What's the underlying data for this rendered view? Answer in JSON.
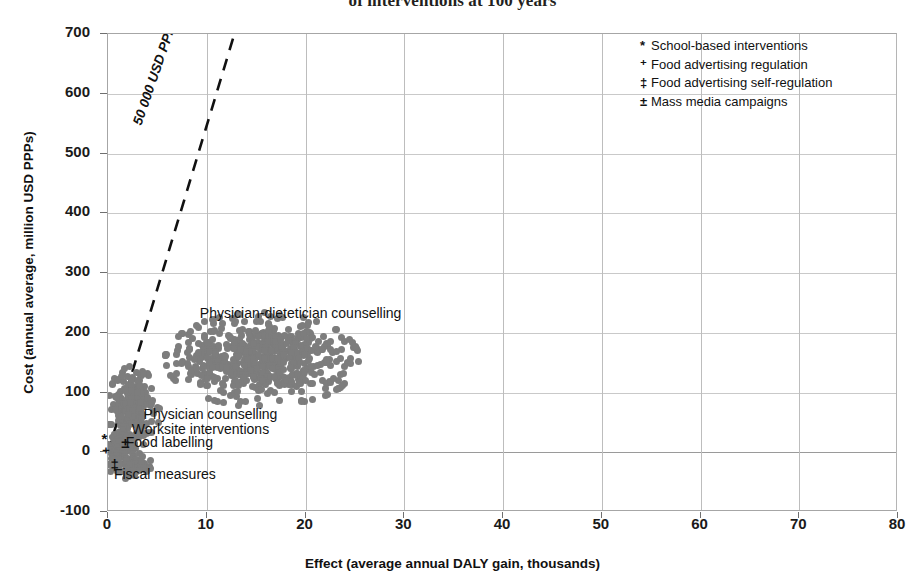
{
  "chart_data": {
    "type": "scatter",
    "title": "of interventions at 100 years",
    "xlabel": "Effect (average annual DALY gain, thousands)",
    "ylabel": "Cost (annual average, million USD PPPs)",
    "xlim": [
      0,
      80
    ],
    "ylim": [
      -100,
      700
    ],
    "xticks": [
      "0",
      "10",
      "20",
      "30",
      "40",
      "50",
      "60",
      "70",
      "80"
    ],
    "yticks": [
      "700",
      "600",
      "500",
      "400",
      "300",
      "200",
      "100",
      "0",
      "-100"
    ],
    "grid": true,
    "legend_position": "top-right",
    "point_color": "#7d7d7d",
    "threshold_line": {
      "label": "50 000 USD PPPs/DALY",
      "style": "dashed",
      "color": "#111111",
      "from": [
        0,
        0
      ],
      "to": [
        12.8,
        700
      ]
    },
    "legend": [
      {
        "symbol": "*",
        "label": "School-based interventions"
      },
      {
        "symbol": "⁺",
        "label": "Food advertising regulation"
      },
      {
        "symbol": "‡",
        "label": "Food advertising self-regulation"
      },
      {
        "symbol": "±",
        "label": "Mass media campaigns"
      }
    ],
    "annotations": [
      {
        "text": "Physician-dietetician counselling",
        "x": 9.3,
        "y": 232
      },
      {
        "text": "Physician counselling",
        "x": 3.6,
        "y": 62
      },
      {
        "text": "Worksite interventions",
        "x": 2.4,
        "y": 38
      },
      {
        "text": "Food labelling",
        "x": 1.8,
        "y": 16
      },
      {
        "text": "Fiscal measures",
        "x": 0.6,
        "y": -38
      }
    ],
    "symbol_markers": [
      {
        "symbol": "*",
        "x": -0.55,
        "y": 22
      },
      {
        "symbol": "⁺",
        "x": -0.55,
        "y": -2
      },
      {
        "symbol": "‡",
        "x": 0.35,
        "y": -22
      },
      {
        "symbol": "±",
        "x": 1.45,
        "y": 16
      }
    ],
    "series": [
      {
        "name": "Physician-dietetician counselling",
        "center": [
          15.6,
          155
        ],
        "spread": [
          4.0,
          32
        ],
        "n": 620,
        "marker_size": 7
      },
      {
        "name": "Physician counselling",
        "center": [
          2.6,
          72
        ],
        "spread": [
          1.05,
          32
        ],
        "n": 230,
        "marker_size": 7
      },
      {
        "name": "Worksite interventions",
        "center": [
          1.35,
          13
        ],
        "spread": [
          0.55,
          11
        ],
        "n": 70,
        "marker_size": 6
      },
      {
        "name": "Food labelling",
        "center": [
          1.1,
          6
        ],
        "spread": [
          0.5,
          7
        ],
        "n": 45,
        "marker_size": 6
      },
      {
        "name": "Fiscal measures",
        "center": [
          2.1,
          -22
        ],
        "spread": [
          0.95,
          9
        ],
        "n": 110,
        "marker_size": 7
      }
    ]
  }
}
